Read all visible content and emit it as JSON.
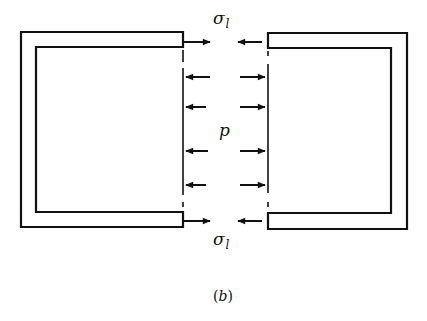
{
  "figure": {
    "caption": "(b)",
    "caption_letter": "b",
    "labels": {
      "sigma_top": "σ",
      "sigma_top_sub": "l",
      "pressure": "p",
      "sigma_bottom": "σ",
      "sigma_bottom_sub": "l"
    },
    "stroke_color": "#111111",
    "background": "#ffffff"
  }
}
